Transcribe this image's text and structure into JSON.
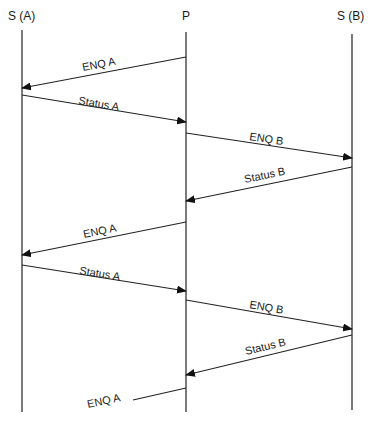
{
  "diagram": {
    "type": "sequence",
    "participants": [
      {
        "id": "SA",
        "label": "S (A)",
        "x": 22
      },
      {
        "id": "P",
        "label": "P",
        "x": 186
      },
      {
        "id": "SB",
        "label": "S (B)",
        "x": 352
      }
    ],
    "messages": [
      {
        "label": "ENQ A",
        "from": "P",
        "to": "SA",
        "y1": 57,
        "y2": 88
      },
      {
        "label": "Status A",
        "from": "SA",
        "to": "P",
        "y1": 95,
        "y2": 122
      },
      {
        "label": "ENQ B",
        "from": "P",
        "to": "SB",
        "y1": 133,
        "y2": 158
      },
      {
        "label": "Status B",
        "from": "SB",
        "to": "P",
        "y1": 167,
        "y2": 201
      },
      {
        "label": "ENQ A",
        "from": "P",
        "to": "SA",
        "y1": 222,
        "y2": 255
      },
      {
        "label": "Status A",
        "from": "SA",
        "to": "P",
        "y1": 265,
        "y2": 291
      },
      {
        "label": "ENQ B",
        "from": "P",
        "to": "SB",
        "y1": 300,
        "y2": 329
      },
      {
        "label": "Status B",
        "from": "SB",
        "to": "P",
        "y1": 335,
        "y2": 375
      },
      {
        "label": "ENQ A",
        "from": "P",
        "to": "SA",
        "partial": true,
        "y1": 388,
        "y2": 400
      }
    ]
  }
}
